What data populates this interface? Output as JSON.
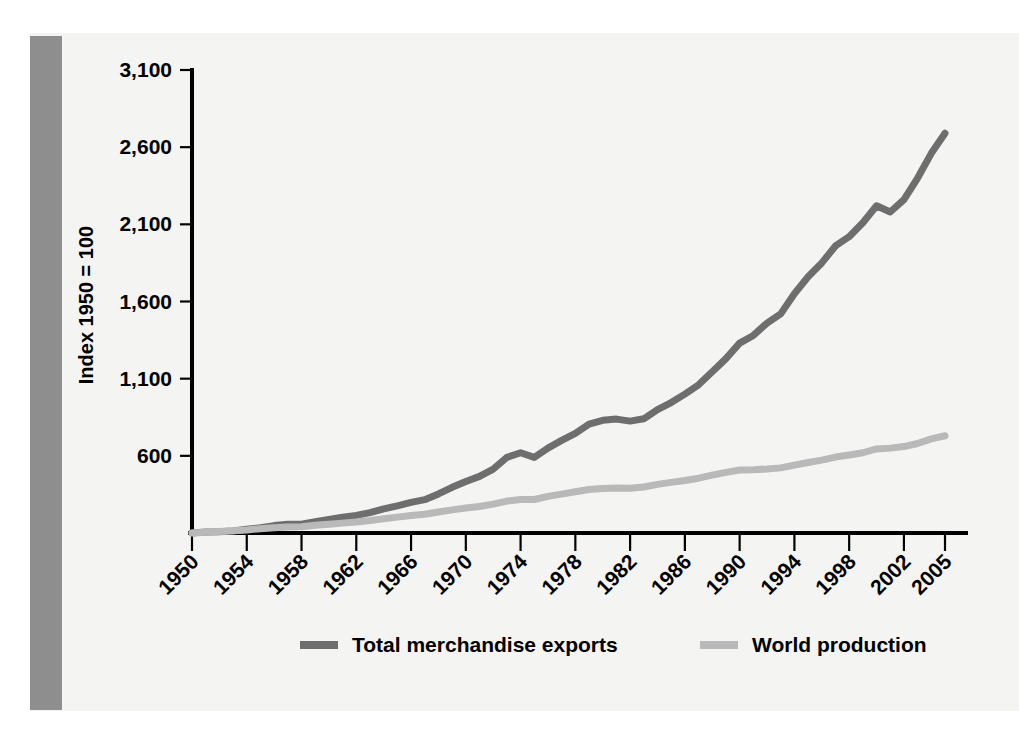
{
  "figure": {
    "background_color": "#f4f4f2",
    "page_color": "#ffffff",
    "left_bar_color": "#8e8e8e"
  },
  "chart_data": {
    "type": "line",
    "title": "",
    "subtitle": "",
    "xlabel": "",
    "ylabel": "Index 1950 = 100",
    "grid": false,
    "legend_position": "bottom",
    "xlim": [
      1950,
      2005
    ],
    "ylim": [
      100,
      3100
    ],
    "xticks": [
      1950,
      1954,
      1958,
      1962,
      1966,
      1970,
      1974,
      1978,
      1982,
      1986,
      1990,
      1994,
      1998,
      2002,
      2005
    ],
    "xtick_labels": [
      "1950",
      "1954",
      "1958",
      "1962",
      "1966",
      "1970",
      "1974",
      "1978",
      "1982",
      "1986",
      "1990",
      "1994",
      "1998",
      "2002",
      "2005"
    ],
    "yticks": [
      600,
      1100,
      1600,
      2100,
      2600,
      3100
    ],
    "ytick_labels": [
      "600",
      "1,100",
      "1,600",
      "2,100",
      "2,600",
      "3,100"
    ],
    "x": [
      1950,
      1951,
      1952,
      1953,
      1954,
      1955,
      1956,
      1957,
      1958,
      1959,
      1960,
      1961,
      1962,
      1963,
      1964,
      1965,
      1966,
      1967,
      1968,
      1969,
      1970,
      1971,
      1972,
      1973,
      1974,
      1975,
      1976,
      1977,
      1978,
      1979,
      1980,
      1981,
      1982,
      1983,
      1984,
      1985,
      1986,
      1987,
      1988,
      1989,
      1990,
      1991,
      1992,
      1993,
      1994,
      1995,
      1996,
      1997,
      1998,
      1999,
      2000,
      2001,
      2002,
      2003,
      2004,
      2005
    ],
    "series": [
      {
        "name": "Total merchandise exports",
        "color": "#6e6e6e",
        "line_width": 7,
        "values": [
          100,
          106,
          108,
          113,
          124,
          134,
          148,
          157,
          157,
          173,
          188,
          202,
          214,
          232,
          256,
          276,
          298,
          316,
          353,
          396,
          434,
          467,
          514,
          590,
          620,
          590,
          650,
          700,
          745,
          805,
          830,
          838,
          825,
          840,
          900,
          945,
          1000,
          1060,
          1145,
          1230,
          1330,
          1380,
          1460,
          1520,
          1650,
          1760,
          1850,
          1960,
          2020,
          2110,
          2220,
          2180,
          2260,
          2400,
          2560,
          2690
        ]
      },
      {
        "name": "World production",
        "color": "#b9b9b9",
        "line_width": 7,
        "values": [
          100,
          105,
          109,
          115,
          120,
          128,
          134,
          139,
          141,
          150,
          157,
          164,
          172,
          181,
          192,
          203,
          214,
          222,
          236,
          250,
          262,
          272,
          287,
          307,
          317,
          317,
          337,
          352,
          367,
          382,
          388,
          392,
          390,
          398,
          415,
          428,
          440,
          455,
          475,
          493,
          508,
          510,
          515,
          522,
          540,
          557,
          572,
          592,
          605,
          620,
          645,
          650,
          660,
          680,
          710,
          730
        ]
      }
    ]
  },
  "legend": {
    "items": [
      {
        "label": "Total merchandise exports",
        "color": "#6e6e6e"
      },
      {
        "label": "World production",
        "color": "#b9b9b9"
      }
    ]
  }
}
